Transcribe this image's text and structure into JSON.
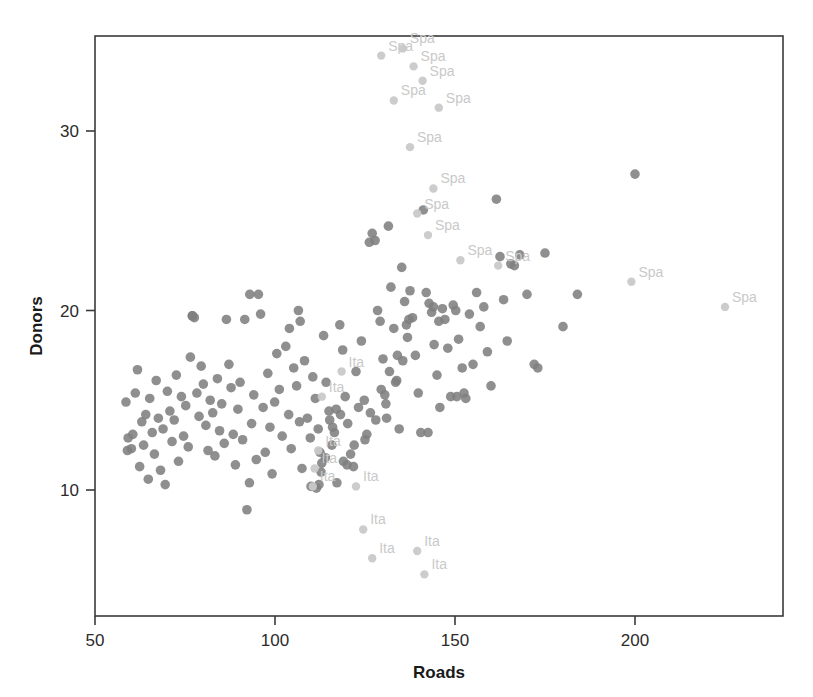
{
  "chart_data": {
    "type": "scatter",
    "title": "",
    "xlabel": "Roads",
    "ylabel": "Donors",
    "xlim": [
      50,
      228
    ],
    "ylim": [
      4.8,
      34.6
    ],
    "xticks": [
      50,
      100,
      150,
      200
    ],
    "xtick_labels": [
      "50",
      "100",
      "150",
      "200"
    ],
    "yticks": [
      10,
      20,
      30
    ],
    "ytick_labels": [
      "10",
      "20",
      "30"
    ],
    "grid": false,
    "legend": false,
    "point_color": "#808080",
    "outlier_point_color": "#c9c9c9",
    "label_color": "#c9c9c9",
    "axis_color": "#3a3a3a",
    "background": "#ffffff",
    "series": [
      {
        "name": "unlabeled",
        "color": "#808080",
        "points": [
          [
            58.6,
            14.9
          ],
          [
            59.2,
            12.9
          ],
          [
            59.0,
            12.2
          ],
          [
            60.1,
            12.3
          ],
          [
            60.5,
            13.1
          ],
          [
            61.2,
            15.4
          ],
          [
            61.8,
            16.7
          ],
          [
            62.4,
            11.3
          ],
          [
            63.0,
            13.8
          ],
          [
            63.5,
            12.5
          ],
          [
            64.1,
            14.2
          ],
          [
            64.8,
            10.6
          ],
          [
            65.2,
            15.1
          ],
          [
            65.9,
            13.2
          ],
          [
            66.5,
            12.0
          ],
          [
            67.0,
            16.1
          ],
          [
            67.6,
            14.0
          ],
          [
            68.2,
            11.1
          ],
          [
            68.9,
            13.4
          ],
          [
            69.5,
            10.3
          ],
          [
            70.1,
            15.5
          ],
          [
            70.8,
            14.4
          ],
          [
            71.4,
            12.7
          ],
          [
            72.0,
            13.9
          ],
          [
            72.6,
            16.4
          ],
          [
            73.2,
            11.6
          ],
          [
            74.0,
            15.2
          ],
          [
            74.6,
            13.0
          ],
          [
            75.2,
            14.7
          ],
          [
            75.9,
            12.4
          ],
          [
            76.5,
            17.4
          ],
          [
            77.1,
            19.7
          ],
          [
            77.6,
            19.6
          ],
          [
            78.3,
            15.4
          ],
          [
            78.9,
            14.1
          ],
          [
            79.5,
            16.9
          ],
          [
            80.1,
            15.9
          ],
          [
            80.8,
            13.6
          ],
          [
            81.4,
            12.2
          ],
          [
            82.0,
            15.0
          ],
          [
            82.7,
            14.3
          ],
          [
            83.3,
            11.9
          ],
          [
            84.0,
            16.2
          ],
          [
            84.6,
            13.3
          ],
          [
            85.2,
            14.8
          ],
          [
            85.9,
            12.6
          ],
          [
            86.5,
            19.5
          ],
          [
            87.2,
            17.0
          ],
          [
            87.8,
            15.7
          ],
          [
            88.4,
            13.1
          ],
          [
            89.0,
            11.4
          ],
          [
            89.7,
            14.5
          ],
          [
            90.3,
            16.0
          ],
          [
            91.0,
            12.8
          ],
          [
            91.6,
            19.5
          ],
          [
            92.2,
            8.9
          ],
          [
            92.9,
            10.4
          ],
          [
            93.5,
            13.7
          ],
          [
            94.1,
            15.3
          ],
          [
            94.8,
            11.7
          ],
          [
            95.4,
            20.9
          ],
          [
            96.0,
            19.8
          ],
          [
            96.7,
            14.6
          ],
          [
            97.3,
            12.1
          ],
          [
            98.0,
            16.5
          ],
          [
            98.6,
            13.5
          ],
          [
            99.2,
            10.9
          ],
          [
            99.9,
            14.9
          ],
          [
            100.5,
            17.6
          ],
          [
            101.2,
            15.6
          ],
          [
            102.0,
            13.0
          ],
          [
            103.0,
            18.0
          ],
          [
            103.8,
            14.2
          ],
          [
            104.5,
            12.3
          ],
          [
            105.2,
            16.8
          ],
          [
            106.0,
            15.8
          ],
          [
            106.8,
            13.8
          ],
          [
            107.5,
            11.2
          ],
          [
            108.2,
            17.2
          ],
          [
            109.0,
            14.0
          ],
          [
            109.8,
            12.9
          ],
          [
            110.5,
            16.3
          ],
          [
            111.2,
            15.1
          ],
          [
            112.0,
            13.4
          ],
          [
            112.8,
            11.0
          ],
          [
            113.5,
            18.6
          ],
          [
            114.2,
            16.0
          ],
          [
            115.0,
            14.4
          ],
          [
            115.8,
            12.5
          ],
          [
            116.5,
            13.2
          ],
          [
            117.2,
            10.4
          ],
          [
            118.0,
            19.2
          ],
          [
            118.8,
            17.8
          ],
          [
            119.5,
            15.2
          ],
          [
            120.2,
            13.7
          ],
          [
            121.0,
            12.0
          ],
          [
            121.8,
            11.3
          ],
          [
            122.5,
            16.6
          ],
          [
            123.2,
            14.6
          ],
          [
            124.0,
            18.3
          ],
          [
            124.8,
            15.0
          ],
          [
            125.5,
            13.1
          ],
          [
            126.2,
            23.8
          ],
          [
            127.0,
            24.3
          ],
          [
            127.8,
            23.9
          ],
          [
            128.5,
            20.0
          ],
          [
            129.2,
            19.4
          ],
          [
            130.0,
            17.3
          ],
          [
            130.8,
            14.8
          ],
          [
            131.5,
            24.7
          ],
          [
            132.2,
            21.3
          ],
          [
            133.0,
            19.0
          ],
          [
            133.8,
            16.1
          ],
          [
            134.5,
            13.4
          ],
          [
            135.2,
            22.4
          ],
          [
            136.0,
            20.5
          ],
          [
            136.8,
            18.5
          ],
          [
            137.5,
            21.1
          ],
          [
            138.2,
            19.6
          ],
          [
            139.0,
            17.5
          ],
          [
            139.8,
            15.4
          ],
          [
            140.5,
            13.2
          ],
          [
            141.2,
            25.6
          ],
          [
            142.0,
            21.0
          ],
          [
            142.8,
            20.4
          ],
          [
            143.5,
            19.9
          ],
          [
            144.2,
            18.1
          ],
          [
            145.0,
            16.4
          ],
          [
            145.8,
            14.6
          ],
          [
            146.5,
            20.1
          ],
          [
            147.2,
            19.5
          ],
          [
            148.0,
            17.9
          ],
          [
            148.8,
            15.2
          ],
          [
            149.5,
            20.3
          ],
          [
            150.2,
            20.0
          ],
          [
            151.0,
            18.4
          ],
          [
            152.0,
            16.8
          ],
          [
            153.0,
            15.1
          ],
          [
            154.0,
            19.8
          ],
          [
            155.0,
            17.0
          ],
          [
            156.0,
            21.0
          ],
          [
            157.0,
            19.1
          ],
          [
            158.0,
            20.2
          ],
          [
            159.0,
            17.7
          ],
          [
            160.0,
            15.8
          ],
          [
            161.5,
            26.2
          ],
          [
            162.5,
            23.0
          ],
          [
            163.5,
            20.6
          ],
          [
            164.5,
            18.3
          ],
          [
            165.5,
            22.6
          ],
          [
            166.5,
            22.5
          ],
          [
            168.0,
            23.1
          ],
          [
            170.0,
            20.9
          ],
          [
            172.0,
            17.0
          ],
          [
            173.0,
            16.8
          ],
          [
            175.0,
            23.2
          ],
          [
            180.0,
            19.1
          ],
          [
            184.0,
            20.9
          ],
          [
            200.0,
            27.6
          ],
          [
            104.0,
            19.0
          ],
          [
            106.5,
            20.0
          ],
          [
            107.0,
            19.4
          ],
          [
            93.0,
            20.9
          ],
          [
            77.0,
            19.7
          ],
          [
            112.5,
            12.1
          ],
          [
            113.0,
            11.5
          ],
          [
            114.0,
            11.8
          ],
          [
            119.0,
            11.6
          ],
          [
            120.0,
            11.4
          ],
          [
            122.0,
            12.5
          ],
          [
            125.0,
            12.8
          ],
          [
            110.0,
            10.2
          ],
          [
            111.5,
            10.1
          ],
          [
            112.2,
            10.3
          ],
          [
            126.5,
            14.3
          ],
          [
            128.0,
            13.9
          ],
          [
            131.0,
            14.0
          ],
          [
            142.5,
            13.2
          ],
          [
            150.5,
            15.2
          ],
          [
            152.5,
            15.4
          ],
          [
            144.0,
            20.2
          ],
          [
            145.5,
            19.4
          ],
          [
            136.5,
            19.2
          ],
          [
            137.2,
            19.5
          ],
          [
            134.0,
            17.5
          ],
          [
            135.5,
            17.2
          ],
          [
            131.8,
            16.6
          ],
          [
            133.5,
            16.0
          ],
          [
            129.5,
            15.6
          ],
          [
            130.5,
            15.3
          ],
          [
            118.2,
            14.2
          ],
          [
            117.0,
            14.5
          ],
          [
            115.2,
            13.9
          ],
          [
            116.0,
            13.5
          ]
        ]
      },
      {
        "name": "Spa-labeled",
        "color": "#c9c9c9",
        "label": "Spa",
        "points": [
          [
            129.5,
            34.2
          ],
          [
            135.5,
            34.6
          ],
          [
            138.5,
            33.6
          ],
          [
            141.0,
            32.8
          ],
          [
            133.0,
            31.7
          ],
          [
            145.5,
            31.3
          ],
          [
            137.5,
            29.1
          ],
          [
            144.0,
            26.8
          ],
          [
            139.5,
            25.4
          ],
          [
            142.5,
            24.2
          ],
          [
            151.5,
            22.8
          ],
          [
            162.0,
            22.5
          ],
          [
            199.0,
            21.6
          ],
          [
            225.0,
            20.2
          ]
        ]
      },
      {
        "name": "Ita-labeled",
        "color": "#c9c9c9",
        "label": "Ita",
        "points": [
          [
            118.5,
            16.6
          ],
          [
            113.0,
            15.2
          ],
          [
            112.0,
            12.2
          ],
          [
            111.0,
            11.2
          ],
          [
            110.5,
            10.2
          ],
          [
            122.5,
            10.2
          ],
          [
            124.5,
            7.8
          ],
          [
            127.0,
            6.2
          ],
          [
            139.5,
            6.6
          ],
          [
            141.5,
            5.3
          ]
        ]
      }
    ]
  },
  "axes": {
    "x_title": "Roads",
    "y_title": "Donors"
  }
}
